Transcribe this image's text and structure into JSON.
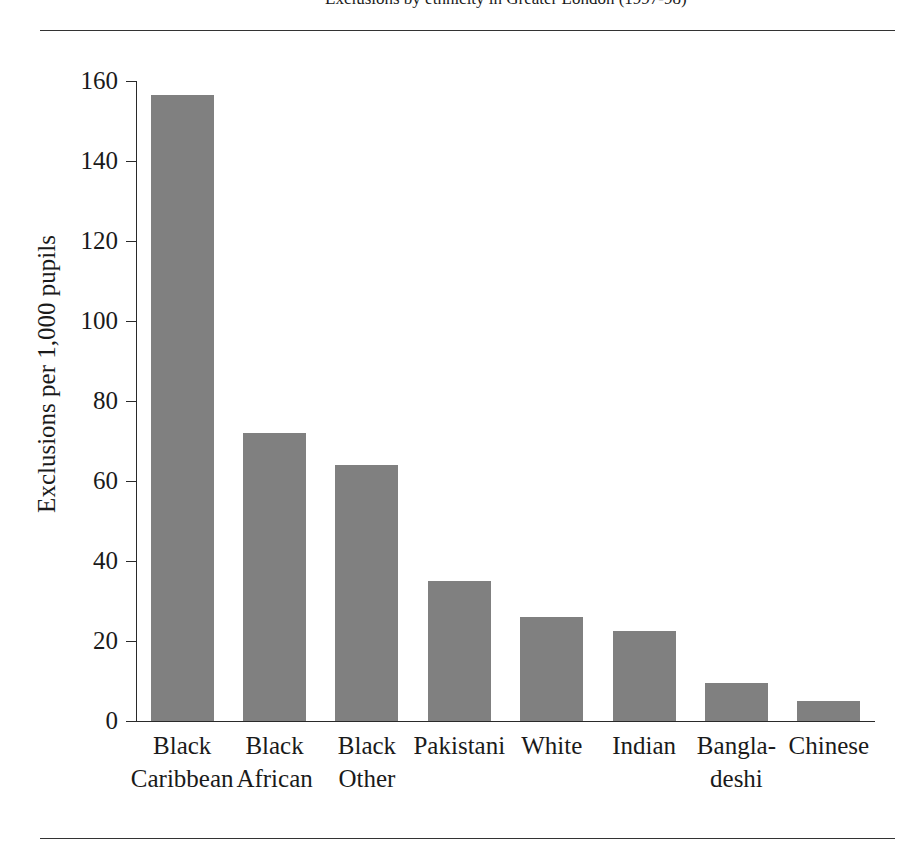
{
  "caption": {
    "text": "Exclusions by ethnicity in Greater London (1997-98)"
  },
  "chart_data": {
    "type": "bar",
    "title": "",
    "xlabel": "",
    "ylabel": "Exclusions per 1,000 pupils",
    "categories": [
      "Black\nCaribbean",
      "Black\nAfrican",
      "Black\nOther",
      "Pakistani",
      "White",
      "Indian",
      "Bangla-\ndeshi",
      "Chinese"
    ],
    "values": [
      156.5,
      72,
      64,
      35,
      26,
      22.5,
      9.5,
      5
    ],
    "ylim": [
      0,
      160
    ],
    "yticks": [
      0,
      20,
      40,
      60,
      80,
      100,
      120,
      140,
      160
    ],
    "ytick_labels": [
      "0",
      "20",
      "40",
      "60",
      "80",
      "100",
      "120",
      "140",
      "160"
    ],
    "grid": false,
    "legend": "none",
    "bar_color": "#808080",
    "axis_color": "#2a2a2a"
  }
}
